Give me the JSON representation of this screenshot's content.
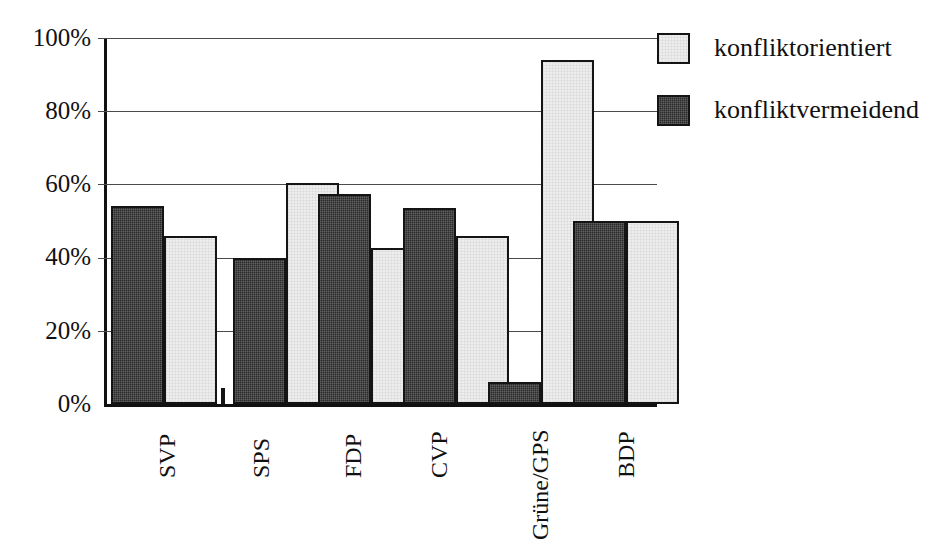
{
  "chart_data": {
    "type": "bar",
    "title": "",
    "subtitle": "",
    "xlabel": "",
    "ylabel": "",
    "categories": [
      "SVP",
      "SPS",
      "FDP",
      "CVP",
      "Grüne/GPS",
      "BDP"
    ],
    "series": [
      {
        "name": "konfliktvermeidend",
        "color": "#2b2b2b",
        "values": [
          54,
          40,
          57.5,
          53.5,
          6,
          50
        ]
      },
      {
        "name": "konfliktorientiert",
        "color": "#ededed",
        "values": [
          46,
          60.4,
          42.5,
          46,
          94,
          50
        ]
      }
    ],
    "ylim": [
      0,
      100
    ],
    "yticks": [
      0,
      20,
      40,
      60,
      80,
      100
    ],
    "ytick_labels": [
      "0%",
      "20%",
      "40%",
      "60%",
      "80%",
      "100%"
    ],
    "grid": true,
    "grid_axis": "y",
    "legend_position": "right-top",
    "series_draw_order": [
      "konfliktvermeidend",
      "konfliktorientiert"
    ]
  },
  "legend": {
    "items": [
      {
        "label": "konfliktorientiert",
        "swatch": "light"
      },
      {
        "label": "konfliktvermeidend",
        "swatch": "dark"
      }
    ]
  },
  "axis": {
    "y_labels": [
      "100%",
      "80%",
      "60%",
      "40%",
      "20%",
      "0%"
    ],
    "x_labels": [
      "SVP",
      "SPS",
      "FDP",
      "CVP",
      "Grüne/GPS",
      "BDP"
    ]
  }
}
